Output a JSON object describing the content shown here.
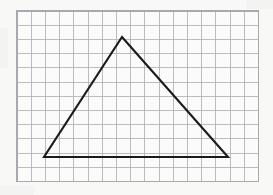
{
  "figure": {
    "kind": "geometry-figure",
    "background_color": "#f8f8f7",
    "paper_color": "#fbfbfa"
  },
  "grid": {
    "label": "square grid",
    "line_color": "#b4b4ba",
    "border_color": "#a8a8ae",
    "origin_x": 17,
    "origin_y": 11,
    "cell_size": 14.2,
    "columns": 17,
    "rows": 12,
    "width": 241.4,
    "height": 170.4
  },
  "shape": {
    "name": "triangle",
    "stroke_color": "#1b1b1b",
    "stroke_width": 2.1,
    "fill": "none",
    "vertex_labels": [
      "apex",
      "bottom-left",
      "bottom-right"
    ],
    "vertices_px": [
      {
        "name": "apex",
        "x": 122,
        "y": 37
      },
      {
        "name": "bottom-right",
        "x": 228,
        "y": 157
      },
      {
        "name": "bottom-left",
        "x": 44,
        "y": 157
      }
    ],
    "vertices_cells": [
      {
        "name": "apex",
        "col": 7.4,
        "row": 1.8
      },
      {
        "name": "bottom-right",
        "col": 14.9,
        "row": 10.3
      },
      {
        "name": "bottom-left",
        "col": 1.9,
        "row": 10.3
      }
    ],
    "base_cells": 13,
    "height_cells": 8.5,
    "points_attr": "122,37 228,157 44,157"
  },
  "smudges": [
    {
      "name": "corner-smudge-top-right",
      "x": 246,
      "y": 0,
      "width": 27,
      "height": 9
    },
    {
      "name": "corner-smudge-bottom-left",
      "x": 0,
      "y": 186,
      "width": 34,
      "height": 9
    },
    {
      "name": "edge-smudge-left",
      "x": 0,
      "y": 28,
      "width": 8,
      "height": 40
    }
  ]
}
